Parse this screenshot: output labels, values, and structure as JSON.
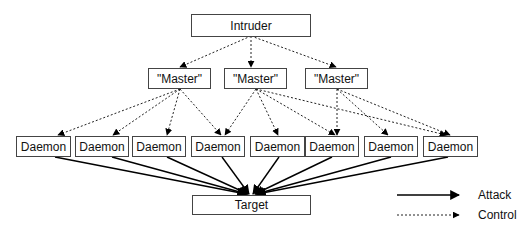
{
  "diagram": {
    "intruder": {
      "label": "Intruder"
    },
    "masters": [
      {
        "label": "\"Master\""
      },
      {
        "label": "\"Master\""
      },
      {
        "label": "\"Master\""
      }
    ],
    "daemons": [
      {
        "label": "Daemon"
      },
      {
        "label": "Daemon"
      },
      {
        "label": "Daemon"
      },
      {
        "label": "Daemon"
      },
      {
        "label": "Daemon"
      },
      {
        "label": "Daemon"
      },
      {
        "label": "Daemon"
      },
      {
        "label": "Daemon"
      }
    ],
    "target": {
      "label": "Target"
    },
    "edges": {
      "control": [
        [
          "intruder",
          "master0"
        ],
        [
          "intruder",
          "master1"
        ],
        [
          "intruder",
          "master2"
        ],
        [
          "master0",
          "daemon0"
        ],
        [
          "master0",
          "daemon1"
        ],
        [
          "master0",
          "daemon2"
        ],
        [
          "master0",
          "daemon3"
        ],
        [
          "master1",
          "daemon3"
        ],
        [
          "master1",
          "daemon4"
        ],
        [
          "master1",
          "daemon5"
        ],
        [
          "master1",
          "daemon7"
        ],
        [
          "master2",
          "daemon5"
        ],
        [
          "master2",
          "daemon6"
        ],
        [
          "master2",
          "daemon7"
        ]
      ],
      "attack": [
        [
          "daemon0",
          "target"
        ],
        [
          "daemon1",
          "target"
        ],
        [
          "daemon2",
          "target"
        ],
        [
          "daemon3",
          "target"
        ],
        [
          "daemon4",
          "target"
        ],
        [
          "daemon5",
          "target"
        ],
        [
          "daemon6",
          "target"
        ],
        [
          "daemon7",
          "target"
        ]
      ]
    },
    "legend": {
      "attack": "Attack",
      "control": "Control"
    }
  }
}
